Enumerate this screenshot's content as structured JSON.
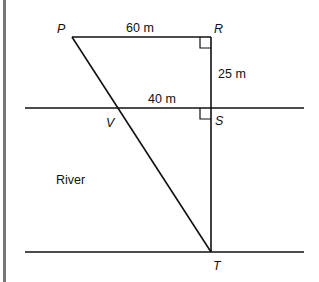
{
  "diagram": {
    "points": {
      "P": {
        "label": "P",
        "x": 72,
        "y": 37
      },
      "R": {
        "label": "R",
        "x": 211,
        "y": 37
      },
      "S": {
        "label": "S",
        "x": 211,
        "y": 108
      },
      "V": {
        "label": "V",
        "x": 118,
        "y": 108
      },
      "T": {
        "label": "T",
        "x": 211,
        "y": 252
      }
    },
    "measurements": {
      "PR": "60 m",
      "RS": "25 m",
      "VS": "40 m"
    },
    "region_label": "River",
    "colors": {
      "line": "#111111",
      "border": "#777777"
    }
  }
}
